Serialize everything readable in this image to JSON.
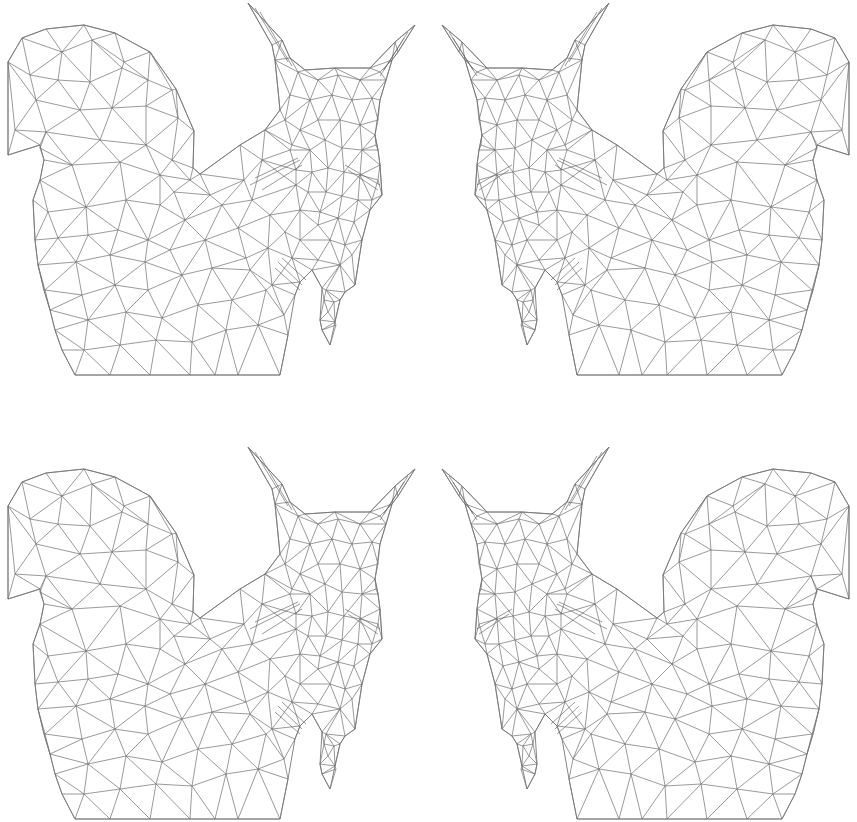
{
  "canvas": {
    "width": 857,
    "height": 822,
    "background": "#ffffff",
    "stroke_color": "#6e6e6e"
  },
  "figure": {
    "style": "triangulated mesh wireframe",
    "outline": [
      [
        8,
        62
      ],
      [
        22,
        38
      ],
      [
        46,
        29
      ],
      [
        84,
        25
      ],
      [
        115,
        33
      ],
      [
        150,
        52
      ],
      [
        176,
        89
      ],
      [
        194,
        131
      ],
      [
        193,
        168
      ],
      [
        200,
        174
      ],
      [
        240,
        145
      ],
      [
        265,
        130
      ],
      [
        280,
        110
      ],
      [
        275,
        60
      ],
      [
        272,
        45
      ],
      [
        248,
        3
      ],
      [
        282,
        40
      ],
      [
        290,
        58
      ],
      [
        305,
        70
      ],
      [
        335,
        68
      ],
      [
        370,
        68
      ],
      [
        395,
        42
      ],
      [
        415,
        25
      ],
      [
        398,
        52
      ],
      [
        392,
        60
      ],
      [
        386,
        80
      ],
      [
        380,
        100
      ],
      [
        375,
        135
      ],
      [
        378,
        150
      ],
      [
        380,
        165
      ],
      [
        382,
        195
      ],
      [
        370,
        210
      ],
      [
        362,
        240
      ],
      [
        355,
        285
      ],
      [
        345,
        292
      ],
      [
        340,
        300
      ],
      [
        335,
        322
      ],
      [
        330,
        345
      ],
      [
        322,
        330
      ],
      [
        320,
        320
      ],
      [
        322,
        288
      ],
      [
        312,
        270
      ],
      [
        300,
        282
      ],
      [
        295,
        295
      ],
      [
        288,
        335
      ],
      [
        280,
        375
      ],
      [
        215,
        375
      ],
      [
        150,
        375
      ],
      [
        75,
        375
      ],
      [
        62,
        350
      ],
      [
        55,
        330
      ],
      [
        50,
        310
      ],
      [
        44,
        290
      ],
      [
        38,
        265
      ],
      [
        35,
        240
      ],
      [
        33,
        200
      ],
      [
        40,
        180
      ],
      [
        44,
        160
      ],
      [
        40,
        145
      ],
      [
        8,
        155
      ]
    ],
    "vertices": [
      [
        62,
        52
      ],
      [
        92,
        40
      ],
      [
        124,
        62
      ],
      [
        30,
        75
      ],
      [
        58,
        80
      ],
      [
        90,
        82
      ],
      [
        122,
        68
      ],
      [
        148,
        80
      ],
      [
        172,
        90
      ],
      [
        36,
        100
      ],
      [
        80,
        110
      ],
      [
        112,
        108
      ],
      [
        146,
        106
      ],
      [
        178,
        118
      ],
      [
        15,
        130
      ],
      [
        46,
        132
      ],
      [
        100,
        140
      ],
      [
        146,
        145
      ],
      [
        172,
        160
      ],
      [
        40,
        148
      ],
      [
        72,
        165
      ],
      [
        120,
        162
      ],
      [
        160,
        175
      ],
      [
        190,
        180
      ],
      [
        48,
        212
      ],
      [
        86,
        207
      ],
      [
        126,
        200
      ],
      [
        160,
        205
      ],
      [
        174,
        192
      ],
      [
        210,
        195
      ],
      [
        58,
        238
      ],
      [
        88,
        235
      ],
      [
        118,
        230
      ],
      [
        148,
        240
      ],
      [
        185,
        220
      ],
      [
        222,
        205
      ],
      [
        45,
        290
      ],
      [
        76,
        262
      ],
      [
        110,
        255
      ],
      [
        145,
        262
      ],
      [
        170,
        250
      ],
      [
        205,
        240
      ],
      [
        238,
        228
      ],
      [
        82,
        295
      ],
      [
        115,
        285
      ],
      [
        148,
        290
      ],
      [
        182,
        275
      ],
      [
        212,
        268
      ],
      [
        246,
        258
      ],
      [
        50,
        330
      ],
      [
        88,
        320
      ],
      [
        126,
        312
      ],
      [
        162,
        318
      ],
      [
        198,
        305
      ],
      [
        232,
        300
      ],
      [
        266,
        290
      ],
      [
        84,
        350
      ],
      [
        120,
        345
      ],
      [
        156,
        340
      ],
      [
        192,
        342
      ],
      [
        226,
        330
      ],
      [
        258,
        325
      ],
      [
        284,
        315
      ],
      [
        110,
        375
      ],
      [
        150,
        375
      ],
      [
        190,
        375
      ],
      [
        238,
        375
      ],
      [
        244,
        180
      ],
      [
        262,
        160
      ],
      [
        252,
        200
      ],
      [
        270,
        215
      ],
      [
        290,
        150
      ],
      [
        296,
        185
      ],
      [
        285,
        232
      ],
      [
        300,
        210
      ],
      [
        268,
        248
      ],
      [
        292,
        258
      ],
      [
        250,
        270
      ],
      [
        272,
        285
      ],
      [
        300,
        240
      ],
      [
        318,
        225
      ],
      [
        298,
        72
      ],
      [
        318,
        80
      ],
      [
        338,
        75
      ],
      [
        360,
        80
      ],
      [
        380,
        72
      ],
      [
        290,
        95
      ],
      [
        310,
        100
      ],
      [
        332,
        95
      ],
      [
        352,
        100
      ],
      [
        372,
        98
      ],
      [
        285,
        120
      ],
      [
        300,
        130
      ],
      [
        318,
        120
      ],
      [
        340,
        120
      ],
      [
        360,
        125
      ],
      [
        378,
        120
      ],
      [
        292,
        145
      ],
      [
        310,
        150
      ],
      [
        325,
        140
      ],
      [
        342,
        148
      ],
      [
        362,
        150
      ],
      [
        376,
        145
      ],
      [
        296,
        170
      ],
      [
        312,
        172
      ],
      [
        328,
        168
      ],
      [
        344,
        172
      ],
      [
        360,
        175
      ],
      [
        378,
        180
      ],
      [
        308,
        192
      ],
      [
        326,
        192
      ],
      [
        342,
        196
      ],
      [
        358,
        200
      ],
      [
        372,
        200
      ],
      [
        320,
        212
      ],
      [
        338,
        218
      ],
      [
        354,
        222
      ],
      [
        345,
        245
      ],
      [
        330,
        240
      ],
      [
        318,
        260
      ],
      [
        340,
        265
      ],
      [
        352,
        255
      ],
      [
        326,
        290
      ],
      [
        334,
        302
      ],
      [
        328,
        312
      ],
      [
        336,
        325
      ],
      [
        324,
        300
      ]
    ],
    "dense_strokes": [
      [
        [
          250,
          185
        ],
        [
          300,
          160
        ]
      ],
      [
        [
          255,
          178
        ],
        [
          298,
          158
        ]
      ],
      [
        [
          262,
          190
        ],
        [
          302,
          165
        ]
      ],
      [
        [
          345,
          165
        ],
        [
          380,
          185
        ]
      ],
      [
        [
          348,
          170
        ],
        [
          378,
          190
        ]
      ],
      [
        [
          275,
          268
        ],
        [
          300,
          290
        ]
      ],
      [
        [
          278,
          262
        ],
        [
          302,
          285
        ]
      ],
      [
        [
          282,
          258
        ],
        [
          306,
          280
        ]
      ],
      [
        [
          255,
          8
        ],
        [
          288,
          62
        ]
      ],
      [
        [
          260,
          12
        ],
        [
          292,
          66
        ]
      ],
      [
        [
          408,
          32
        ],
        [
          384,
          70
        ]
      ],
      [
        [
          404,
          38
        ],
        [
          380,
          76
        ]
      ]
    ]
  },
  "placements": [
    {
      "name": "top-left",
      "dx": 0,
      "dy": 0,
      "mirror": false
    },
    {
      "name": "top-right",
      "dx": 857,
      "dy": 0,
      "mirror": true
    },
    {
      "name": "bottom-left",
      "dx": 0,
      "dy": 444,
      "mirror": false
    },
    {
      "name": "bottom-right",
      "dx": 857,
      "dy": 444,
      "mirror": true
    }
  ]
}
